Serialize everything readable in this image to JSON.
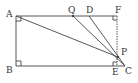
{
  "diagram": {
    "type": "geometry",
    "points": {
      "A": {
        "label": "A",
        "x": 16,
        "y": 16
      },
      "B": {
        "label": "B",
        "x": 16,
        "y": 66
      },
      "E": {
        "label": "E",
        "x": 117,
        "y": 66
      },
      "F": {
        "label": "F",
        "x": 117,
        "y": 16
      },
      "C": {
        "label": "C",
        "x": 125,
        "y": 66
      },
      "P": {
        "label": "P",
        "x": 118,
        "y": 57
      },
      "Q": {
        "label": "Q",
        "x": 73,
        "y": 16
      },
      "D": {
        "label": "D",
        "x": 89,
        "y": 16
      }
    },
    "segments": [
      [
        "A",
        "F"
      ],
      [
        "A",
        "B"
      ],
      [
        "B",
        "C"
      ],
      [
        "A",
        "P"
      ],
      [
        "Q",
        "C"
      ],
      [
        "D",
        "C"
      ]
    ],
    "dashed_segments": [
      [
        "F",
        "E"
      ]
    ],
    "right_angles": [
      "A",
      "B",
      "F",
      "E"
    ]
  }
}
